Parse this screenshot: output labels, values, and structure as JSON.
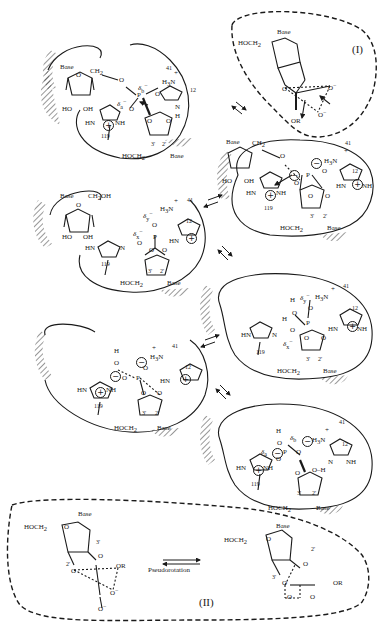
{
  "diagram": {
    "type": "reaction-mechanism",
    "stroke_color": "#1a1a1a",
    "background": "#ffffff"
  },
  "labels": {
    "base": "Base",
    "ch2": "CH",
    "ch2_sub": "2",
    "ch2oh": "CH",
    "ch2oh_sub": "2",
    "ch2oh_tail": "OH",
    "hoch2": "HOCH",
    "hoch2_sub": "2",
    "ho": "HO",
    "oh": "OH",
    "o": "O",
    "p": "P",
    "h": "H",
    "h3n": "H",
    "h3n_sub": "3",
    "h3n_tail": "N",
    "plus": "+",
    "minus": "−",
    "oplus": "+",
    "ominus": "−",
    "hn": "HN",
    "nh": "NH",
    "n": "N",
    "or": "OR",
    "o_minus": "O",
    "res_41": "41",
    "res_12": "12",
    "res_119": "119",
    "c3": "3'",
    "c2": "2'",
    "delta_a": "δ",
    "delta_a_sub": "a",
    "delta_b": "δ",
    "delta_b_sub": "b",
    "delta_x": "δ",
    "delta_x_sub": "x",
    "delta_y": "δ",
    "delta_y_sub": "y",
    "delta_sup": "−"
  },
  "insets": {
    "I": {
      "label": "(I)"
    },
    "II": {
      "label": "(II)",
      "arrow_label": "Pseudorotation"
    }
  },
  "panels": [
    {
      "id": "step1",
      "description": "Substrate bound; His12 as general base, His119 as acid, Lys41 stabilizing"
    },
    {
      "id": "step2",
      "description": "Pentacovalent transition state; 5'-O leaving group protonated by His119"
    },
    {
      "id": "step3",
      "description": "2',3'-cyclic phosphate intermediate; leaving nucleoside released"
    },
    {
      "id": "step4",
      "description": "Water enters active site; cyclic phosphate"
    },
    {
      "id": "step5",
      "description": "Water attacks phosphorus; pentacovalent intermediate"
    },
    {
      "id": "step6",
      "description": "Hydrolysis product 3'-phosphate formed; His12 reprotonated"
    }
  ],
  "equilibrium_arrows": 5
}
